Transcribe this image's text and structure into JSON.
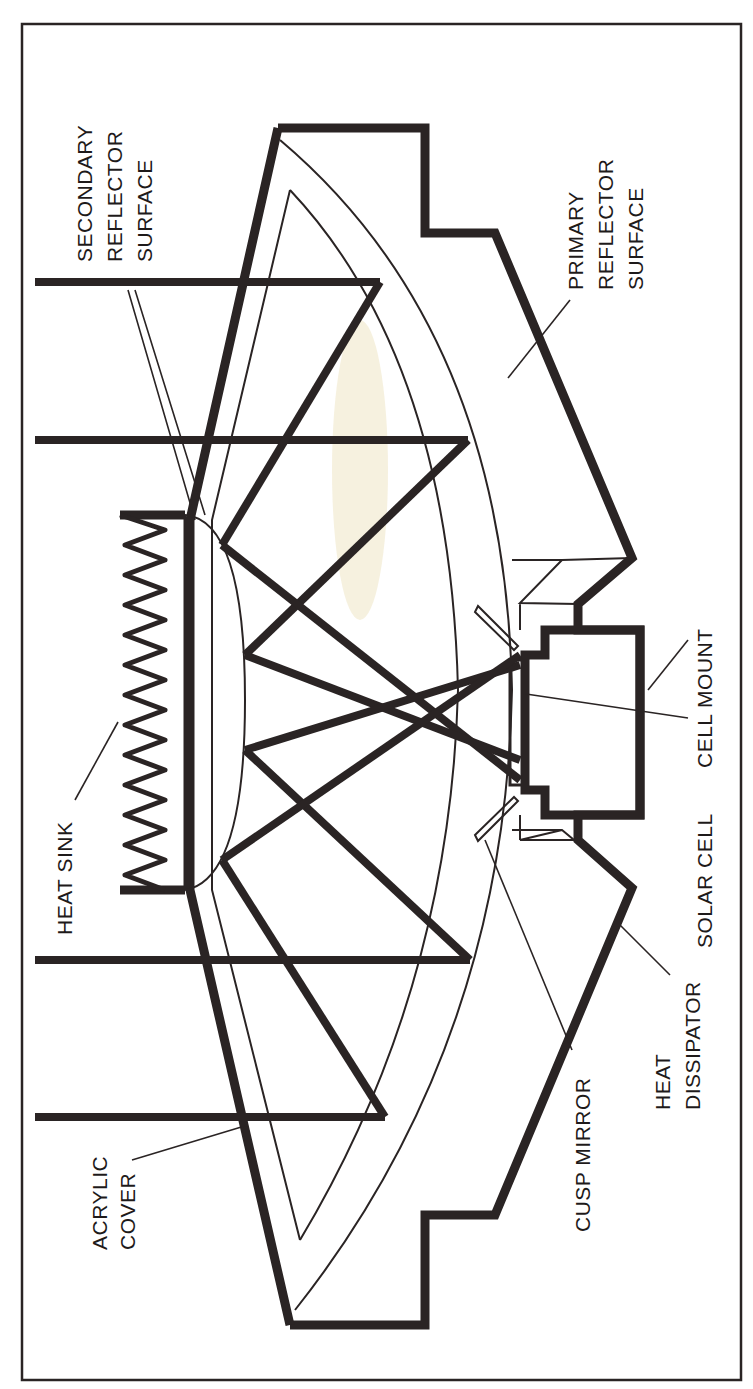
{
  "figure": {
    "orientation": "rotated-90-ccw",
    "colors": {
      "ink": "#2a2424",
      "paper": "#ffffff",
      "stain": "#efe6c4"
    }
  },
  "labels": {
    "secondary_reflector": [
      "SECONDARY",
      "REFLECTOR",
      "SURFACE"
    ],
    "primary_reflector": [
      "PRIMARY",
      "REFLECTOR",
      "SURFACE"
    ],
    "heat_sink": "HEAT SINK",
    "cell_mount": "CELL MOUNT",
    "solar_cell": "SOLAR CELL",
    "acrylic_cover": [
      "ACRYLIC",
      "COVER"
    ],
    "cusp_mirror": "CUSP MIRROR",
    "heat_dissipator": [
      "HEAT",
      "DISSIPATOR"
    ]
  }
}
